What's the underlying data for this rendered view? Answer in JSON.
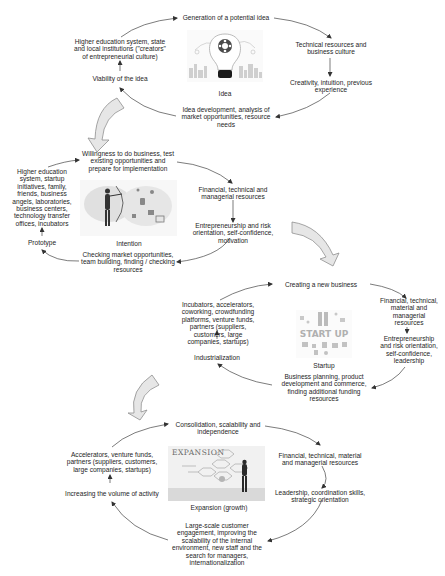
{
  "stages": [
    {
      "name": "Idea",
      "top": "Generation of a potential idea",
      "right_top": "Technical resources and business culture",
      "right_bottom": "Creativity, intuition, previous experience",
      "bottom": "Idea development, analysis of market opportunities, resource needs",
      "left_bottom": "Viability of the idea",
      "left_top": "Higher education system, state and local institutions (\"creators\" of entrepreneurial culture)",
      "icon": "lightbulb-gear-icon"
    },
    {
      "name": "Intention",
      "top": "Willingness to do business, test existing opportunities and prepare for implementation",
      "right_top": "Financial, technical and managerial resources",
      "right_bottom": "Entrepreneurship and risk orientation, self-confidence, motivation",
      "bottom": "Checking market opportunities, team building, finding / checking resources",
      "left_bottom": "Prototype",
      "left_top": "Higher education system, startup initiatives, family, friends, business angels, laboratories, business centers, technology transfer offices, incubators",
      "icon": "archer-target-icon"
    },
    {
      "name": "Startup",
      "top": "Creating a new business",
      "right_top": "Financial, technical, material and managerial resources",
      "right_bottom": "Entrepreneurship and risk orientation, self-confidence, leadership",
      "bottom": "Business planning, product development and commerce, finding additional funding resources",
      "left_bottom": "Industrialization",
      "left_top": "Incubators, accelerators, coworking, crowdfunding platforms, venture funds, partners (suppliers, customers, large companies, startups)",
      "icon": "start-up-icon",
      "icon_text": "START UP"
    },
    {
      "name": "Expansion (growth)",
      "top": "Consolidation, scalability and independence",
      "right_top": "Financial, technical, material and managerial resources",
      "right_bottom": "Leadership, coordination skills, strategic orientation",
      "bottom": "Large-scale customer engagement, improving the scalability of the internal environment, new staff and the search for managers, internationalization",
      "left_bottom": "Increasing the volume of activity",
      "left_top": "Accelerators, venture funds, partners (suppliers, customers, large companies, startups)",
      "icon": "expansion-board-icon",
      "icon_text": "EXPANSION"
    }
  ],
  "colors": {
    "text": "#1e1e1e",
    "arrow": "#333333",
    "block_arrow_fill": "#e4e4e4",
    "block_arrow_stroke": "#8a8a8a"
  }
}
